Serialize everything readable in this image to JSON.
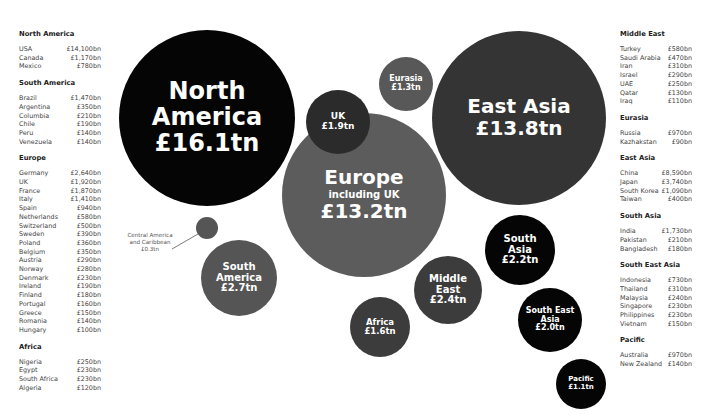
{
  "chart_data": {
    "type": "bubble",
    "title": "",
    "unit": "GBP",
    "bubbles": [
      {
        "label": "North America",
        "value_text": "£16.1tn",
        "value_tn": 16.1,
        "color": "#050505",
        "cx": 207,
        "cy": 118,
        "r": 88,
        "font": 24
      },
      {
        "label": "East Asia",
        "value_text": "£13.8tn",
        "value_tn": 13.8,
        "color": "#343434",
        "cx": 519,
        "cy": 118,
        "r": 87,
        "font": 20
      },
      {
        "label": "Europe",
        "sublabel": "including UK",
        "value_text": "£13.2tn",
        "value_tn": 13.2,
        "color": "#5c5c5c",
        "cx": 364,
        "cy": 195,
        "r": 82,
        "font": 20
      },
      {
        "label": "UK",
        "value_text": "£1.9tn",
        "value_tn": 1.9,
        "color": "#2b2b2b",
        "cx": 338,
        "cy": 122,
        "r": 32,
        "font": 9
      },
      {
        "label": "Eurasia",
        "value_text": "£1.3tn",
        "value_tn": 1.3,
        "color": "#585858",
        "cx": 406,
        "cy": 84,
        "r": 27,
        "font": 8
      },
      {
        "label": "Central America and Caribbean",
        "value_text": "£0.3tn",
        "value_tn": 0.3,
        "color": "#555555",
        "cx": 207,
        "cy": 228,
        "r": 11,
        "font": 0
      },
      {
        "label": "South America",
        "value_text": "£2.7tn",
        "value_tn": 2.7,
        "color": "#555555",
        "cx": 239,
        "cy": 278,
        "r": 38,
        "font": 10
      },
      {
        "label": "Middle East",
        "value_text": "£2.4tn",
        "value_tn": 2.4,
        "color": "#3c3c3c",
        "cx": 448,
        "cy": 290,
        "r": 34,
        "font": 10
      },
      {
        "label": "Africa",
        "value_text": "£1.6tn",
        "value_tn": 1.6,
        "color": "#3c3c3c",
        "cx": 380,
        "cy": 327,
        "r": 30,
        "font": 8.5
      },
      {
        "label": "South Asia",
        "value_text": "£2.2tn",
        "value_tn": 2.2,
        "color": "#050505",
        "cx": 520,
        "cy": 250,
        "r": 35,
        "font": 10
      },
      {
        "label": "South East Asia",
        "value_text": "£2.0tn",
        "value_tn": 2.0,
        "color": "#050505",
        "cx": 550,
        "cy": 320,
        "r": 32,
        "font": 8
      },
      {
        "label": "Pacific",
        "value_text": "£1.1tn",
        "value_tn": 1.1,
        "color": "#050505",
        "cx": 581,
        "cy": 384,
        "r": 25,
        "font": 7
      }
    ],
    "legend_position": "left and right columns",
    "grid": false
  },
  "bubble_text": {
    "north_america": [
      "North",
      "America",
      "£16.1tn"
    ],
    "east_asia": [
      "East Asia",
      "£13.8tn"
    ],
    "europe": [
      "Europe",
      "including UK",
      "£13.2tn"
    ],
    "uk": [
      "UK",
      "£1.9tn"
    ],
    "eurasia": [
      "Eurasia",
      "£1.3tn"
    ],
    "south_america": [
      "South",
      "America",
      "£2.7tn"
    ],
    "middle_east": [
      "Middle",
      "East",
      "£2.4tn"
    ],
    "africa": [
      "Africa",
      "£1.6tn"
    ],
    "south_asia": [
      "South",
      "Asia",
      "£2.2tn"
    ],
    "south_east_asia": [
      "South East",
      "Asia",
      "£2.0tn"
    ],
    "pacific": [
      "Pacific",
      "£1.1tn"
    ]
  },
  "callout": {
    "central_america": [
      "Central America",
      "and Caribbean",
      "£0.3tn"
    ]
  },
  "left_column": [
    {
      "region": "North America",
      "rows": [
        [
          "USA",
          "£14,100bn"
        ],
        [
          "Canada",
          "£1,170bn"
        ],
        [
          "Mexico",
          "£780bn"
        ]
      ]
    },
    {
      "region": "South America",
      "rows": [
        [
          "Brazil",
          "£1,470bn"
        ],
        [
          "Argentina",
          "£350bn"
        ],
        [
          "Columbia",
          "£210bn"
        ],
        [
          "Chile",
          "£190bn"
        ],
        [
          "Peru",
          "£140bn"
        ],
        [
          "Venezuela",
          "£140bn"
        ]
      ]
    },
    {
      "region": "Europe",
      "rows": [
        [
          "Germany",
          "£2,640bn"
        ],
        [
          "UK",
          "£1,920bn"
        ],
        [
          "France",
          "£1,870bn"
        ],
        [
          "Italy",
          "£1,410bn"
        ],
        [
          "Spain",
          "£940bn"
        ],
        [
          "Netherlands",
          "£580bn"
        ],
        [
          "Switzerland",
          "£500bn"
        ],
        [
          "Sweden",
          "£390bn"
        ],
        [
          "Poland",
          "£360bn"
        ],
        [
          "Belgium",
          "£350bn"
        ],
        [
          "Austria",
          "£290bn"
        ],
        [
          "Norway",
          "£280bn"
        ],
        [
          "Denmark",
          "£230bn"
        ],
        [
          "Ireland",
          "£190bn"
        ],
        [
          "Finland",
          "£180bn"
        ],
        [
          "Portugal",
          "£160bn"
        ],
        [
          "Greece",
          "£150bn"
        ],
        [
          "Romania",
          "£140bn"
        ],
        [
          "Hungary",
          "£100bn"
        ]
      ]
    },
    {
      "region": "Africa",
      "rows": [
        [
          "Nigeria",
          "£250bn"
        ],
        [
          "Egypt",
          "£230bn"
        ],
        [
          "South Africa",
          "£230bn"
        ],
        [
          "Algeria",
          "£120bn"
        ]
      ]
    }
  ],
  "right_column": [
    {
      "region": "Middle East",
      "rows": [
        [
          "Turkey",
          "£580bn"
        ],
        [
          "Saudi Arabia",
          "£470bn"
        ],
        [
          "Iran",
          "£310bn"
        ],
        [
          "Israel",
          "£290bn"
        ],
        [
          "UAE",
          "£250bn"
        ],
        [
          "Qatar",
          "£130bn"
        ],
        [
          "Iraq",
          "£110bn"
        ]
      ]
    },
    {
      "region": "Eurasia",
      "rows": [
        [
          "Russia",
          "£970bn"
        ],
        [
          "Kazhakstan",
          "£90bn"
        ]
      ]
    },
    {
      "region": "East Asia",
      "rows": [
        [
          "China",
          "£8,590bn"
        ],
        [
          "Japan",
          "£3,740bn"
        ],
        [
          "South Korea",
          "£1,090bn"
        ],
        [
          "Taiwan",
          "£400bn"
        ]
      ]
    },
    {
      "region": "South Asia",
      "rows": [
        [
          "India",
          "£1,730bn"
        ],
        [
          "Pakistan",
          "£210bn"
        ],
        [
          "Bangladesh",
          "£180bn"
        ]
      ]
    },
    {
      "region": "South East Asia",
      "rows": [
        [
          "Indonesia",
          "£730bn"
        ],
        [
          "Thailand",
          "£310bn"
        ],
        [
          "Malaysia",
          "£240bn"
        ],
        [
          "Singapore",
          "£230bn"
        ],
        [
          "Philippines",
          "£230bn"
        ],
        [
          "Vietnam",
          "£150bn"
        ]
      ]
    },
    {
      "region": "Pacific",
      "rows": [
        [
          "Australia",
          "£970bn"
        ],
        [
          "New Zealand",
          "£140bn"
        ]
      ]
    }
  ]
}
